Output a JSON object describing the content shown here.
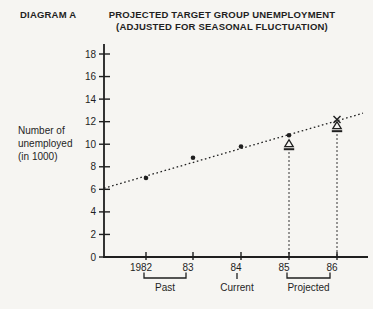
{
  "page": {
    "diagram_label": "DIAGRAM A",
    "title_line1": "PROJECTED TARGET GROUP UNEMPLOYMENT",
    "title_line2": "(ADJUSTED FOR SEASONAL FLUCTUATION)",
    "ylabel_lines": [
      "Number of",
      "unemployed",
      "(in 1000)"
    ]
  },
  "colors": {
    "ink": "#1f1f1f",
    "paper": "#f6f5f2"
  },
  "chart_data": {
    "type": "scatter",
    "title": "PROJECTED TARGET GROUP UNEMPLOYMENT (ADJUSTED FOR SEASONAL FLUCTUATION)",
    "ylabel": "Number of unemployed (in 1000)",
    "ylim": [
      0,
      18
    ],
    "yticks": [
      0,
      2,
      4,
      6,
      8,
      10,
      12,
      14,
      16,
      18
    ],
    "categories": [
      "1982",
      "83",
      "84",
      "85",
      "86"
    ],
    "grid": false,
    "legend": "none",
    "series": [
      {
        "name": "recorded-unemployment",
        "marker": "dot",
        "points": [
          {
            "x": "1982",
            "y": 7.0
          },
          {
            "x": "83",
            "y": 8.8
          },
          {
            "x": "84",
            "y": 9.8
          },
          {
            "x": "85",
            "y": 10.8
          }
        ]
      },
      {
        "name": "projected-unemployment",
        "marker": "x",
        "points": [
          {
            "x": "86",
            "y": 12.2
          }
        ]
      },
      {
        "name": "seasonally-adjusted-estimate",
        "marker": "triangle",
        "points": [
          {
            "x": "85",
            "y": 10.0
          },
          {
            "x": "86",
            "y": 11.6
          }
        ]
      }
    ],
    "trend_line": {
      "style": "dotted",
      "from_y": 6.1,
      "to_y": 12.75
    },
    "guides": [
      "85",
      "86"
    ],
    "periods": [
      {
        "label": "Past",
        "from": "1982",
        "to": "83"
      },
      {
        "label": "Current",
        "at": "84"
      },
      {
        "label": "Projected",
        "from": "85",
        "to": "86"
      }
    ]
  }
}
